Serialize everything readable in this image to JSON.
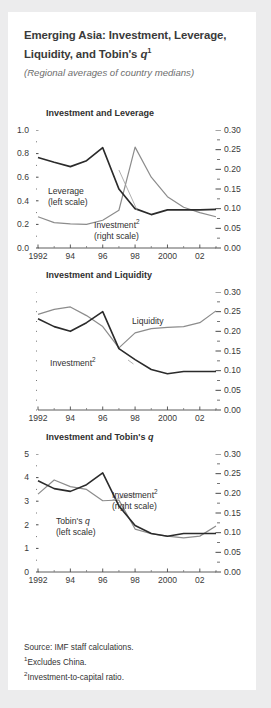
{
  "figure": {
    "title_line1": "Emerging Asia: Investment, Leverage,",
    "title_line2_pre": "Liquidity, and Tobin's ",
    "title_q": "q",
    "title_footnote_marker": "1",
    "subtitle": "(Regional averages of country medians)",
    "source": "Source: IMF staff calculations.",
    "footnote1_marker": "1",
    "footnote1": "Excludes China.",
    "footnote2_marker": "2",
    "footnote2": "Investment-to-capital ratio."
  },
  "chart_data": [
    {
      "type": "line",
      "title": "Investment and Leverage",
      "panel": 1,
      "x": [
        1992,
        1993,
        1994,
        1995,
        1996,
        1997,
        1998,
        1999,
        2000,
        2001,
        2002,
        2003
      ],
      "xlabel": "",
      "xtick_labels": [
        "1992",
        "94",
        "96",
        "98",
        "2000",
        "02"
      ],
      "xtick_values": [
        1992,
        1994,
        1996,
        1998,
        2000,
        2002
      ],
      "xlim": [
        1992,
        2003
      ],
      "grid": false,
      "left_axis": {
        "ylim": [
          0.0,
          1.0
        ],
        "ticks": [
          0.0,
          0.2,
          0.4,
          0.6,
          0.8,
          1.0
        ],
        "tick_labels": [
          "0.0",
          "0.2",
          "0.4",
          "0.6",
          "0.8",
          "1.0"
        ],
        "minor_ticks": [
          0.1,
          0.3,
          0.5,
          0.7,
          0.9
        ]
      },
      "right_axis": {
        "ylim": [
          0.0,
          0.3
        ],
        "ticks": [
          0.0,
          0.05,
          0.1,
          0.15,
          0.2,
          0.25,
          0.3
        ],
        "tick_labels": [
          "0.00",
          "0.05",
          "0.10",
          "0.15",
          "0.20",
          "0.25",
          "0.30"
        ],
        "minor_ticks": [
          0.025,
          0.075,
          0.125,
          0.175,
          0.225,
          0.275
        ]
      },
      "series": [
        {
          "name": "Leverage",
          "axis": "left",
          "label": "Leverage",
          "label_sub": "(left scale)",
          "color": "#8c8c8c",
          "values": [
            0.265,
            0.215,
            0.205,
            0.2,
            0.235,
            0.32,
            0.855,
            0.6,
            0.435,
            0.345,
            0.3,
            0.265
          ]
        },
        {
          "name": "Investment",
          "axis": "right",
          "label": "Investment",
          "label_footnote": "2",
          "label_sub": "(right scale)",
          "color": "#2b2b2b",
          "values": [
            0.23,
            0.218,
            0.207,
            0.222,
            0.255,
            0.15,
            0.1,
            0.085,
            0.097,
            0.097,
            0.097,
            0.098
          ]
        }
      ]
    },
    {
      "type": "line",
      "title": "Investment and Liquidity",
      "panel": 2,
      "x": [
        1992,
        1993,
        1994,
        1995,
        1996,
        1997,
        1998,
        1999,
        2000,
        2001,
        2002,
        2003
      ],
      "xlabel": "",
      "xtick_labels": [
        "1992",
        "94",
        "96",
        "98",
        "2000",
        "02"
      ],
      "xtick_values": [
        1992,
        1994,
        1996,
        1998,
        2000,
        2002
      ],
      "xlim": [
        1992,
        2003
      ],
      "grid": false,
      "left_axis": {
        "ylim": [
          0.0,
          0.3
        ],
        "ticks": [],
        "tick_labels": [],
        "minor_ticks": [
          0.0,
          0.025,
          0.05,
          0.075,
          0.1,
          0.125,
          0.15,
          0.175,
          0.2,
          0.225,
          0.25,
          0.275,
          0.3
        ]
      },
      "right_axis": {
        "ylim": [
          0.0,
          0.3
        ],
        "ticks": [
          0.0,
          0.05,
          0.1,
          0.15,
          0.2,
          0.25,
          0.3
        ],
        "tick_labels": [
          "0.00",
          "0.05",
          "0.10",
          "0.15",
          "0.20",
          "0.25",
          "0.30"
        ],
        "minor_ticks": [
          0.025,
          0.075,
          0.125,
          0.175,
          0.225,
          0.275
        ]
      },
      "series": [
        {
          "name": "Liquidity",
          "axis": "left",
          "label": "Liquidity",
          "color": "#8c8c8c",
          "values": [
            0.243,
            0.256,
            0.262,
            0.24,
            0.212,
            0.158,
            0.196,
            0.207,
            0.21,
            0.212,
            0.222,
            0.252
          ]
        },
        {
          "name": "Investment",
          "axis": "right",
          "label": "Investment",
          "label_footnote": "2",
          "color": "#2b2b2b",
          "values": [
            0.232,
            0.212,
            0.2,
            0.222,
            0.25,
            0.156,
            0.128,
            0.103,
            0.092,
            0.098,
            0.098,
            0.098
          ]
        }
      ]
    },
    {
      "type": "line",
      "title_pre": "Investment and Tobin's ",
      "title_q": "q",
      "title": "Investment and Tobin's q",
      "panel": 3,
      "x": [
        1992,
        1993,
        1994,
        1995,
        1996,
        1997,
        1998,
        1999,
        2000,
        2001,
        2002,
        2003
      ],
      "xlabel": "",
      "xtick_labels": [
        "1992",
        "94",
        "96",
        "98",
        "2000",
        "02"
      ],
      "xtick_values": [
        1992,
        1994,
        1996,
        1998,
        2000,
        2002
      ],
      "xlim": [
        1992,
        2003
      ],
      "grid": false,
      "left_axis": {
        "ylim": [
          0,
          5
        ],
        "ticks": [
          0,
          1,
          2,
          3,
          4,
          5
        ],
        "tick_labels": [
          "0",
          "1",
          "2",
          "3",
          "4",
          "5"
        ],
        "minor_ticks": [
          0.5,
          1.5,
          2.5,
          3.5,
          4.5
        ]
      },
      "right_axis": {
        "ylim": [
          0.0,
          0.3
        ],
        "ticks": [
          0.0,
          0.05,
          0.1,
          0.15,
          0.2,
          0.25,
          0.3
        ],
        "tick_labels": [
          "0.00",
          "0.05",
          "0.10",
          "0.15",
          "0.20",
          "0.25",
          "0.30"
        ],
        "minor_ticks": [
          0.025,
          0.075,
          0.125,
          0.175,
          0.225,
          0.275
        ]
      },
      "series": [
        {
          "name": "Tobin's q",
          "axis": "left",
          "label_pre": "Tobin's ",
          "label_q": "q",
          "label_sub": "(left scale)",
          "color": "#8c8c8c",
          "values": [
            3.3,
            3.9,
            3.62,
            3.5,
            3.02,
            3.05,
            1.82,
            1.62,
            1.52,
            1.45,
            1.52,
            1.95
          ]
        },
        {
          "name": "Investment",
          "axis": "right",
          "label": "Investment",
          "label_footnote": "2",
          "label_sub": "(right scale)",
          "color": "#2b2b2b",
          "values": [
            0.232,
            0.212,
            0.205,
            0.222,
            0.252,
            0.168,
            0.118,
            0.098,
            0.091,
            0.098,
            0.098,
            0.098
          ]
        }
      ]
    }
  ]
}
